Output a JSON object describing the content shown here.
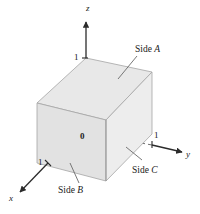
{
  "figure": {
    "type": "3d-coordinate-cube-diagram",
    "axes": [
      {
        "name": "x",
        "label": "x",
        "direction": "lower-left",
        "tick_label": "1"
      },
      {
        "name": "y",
        "label": "y",
        "direction": "right",
        "tick_label": "1"
      },
      {
        "name": "z",
        "label": "z",
        "direction": "up",
        "tick_label": "1"
      }
    ],
    "origin_label": "0",
    "face_labels": [
      {
        "id": "side-a",
        "text_prefix": "Side ",
        "text_italic": "A",
        "face": "top"
      },
      {
        "id": "side-b",
        "text_prefix": "Side ",
        "text_italic": "B",
        "face": "front-left"
      },
      {
        "id": "side-c",
        "text_prefix": "Side ",
        "text_italic": "C",
        "face": "front-right"
      }
    ],
    "colors": {
      "background": "#ffffff",
      "cube_top_face": "#e8e8e8",
      "cube_left_face": "#e0e0e0",
      "cube_right_face": "#ededed",
      "cube_edge": "#9a9a9a",
      "axis_line": "#2b2b2b",
      "dashed_axis": "#6e6e6e",
      "leader_line": "#4a4a4a",
      "text": "#1a1a1a"
    }
  }
}
